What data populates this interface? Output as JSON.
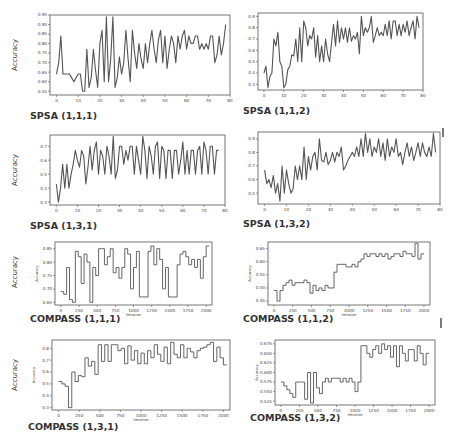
{
  "chart_data": [
    {
      "id": "spsa-111",
      "type": "line",
      "title": "SPSA (1,1,1)",
      "xlabel": "",
      "ylabel": "Accuracy",
      "outer_ylabel": "Accuracy",
      "xlim": [
        -3,
        80
      ],
      "ylim": [
        0.53,
        0.95
      ],
      "xticks": [
        0,
        10,
        20,
        30,
        40,
        50,
        60,
        70,
        80
      ],
      "yticks": [
        0.55,
        0.6,
        0.65,
        0.7,
        0.75,
        0.8,
        0.85,
        0.9,
        0.95
      ],
      "ytick_labels": [
        "0.55",
        "0.60",
        "0.65",
        "0.70",
        "0.75",
        "0.80",
        "0.85",
        "0.90",
        "0.95"
      ],
      "x": [
        0,
        1,
        2,
        3,
        4,
        5,
        6,
        7,
        8,
        9,
        10,
        11,
        12,
        13,
        14,
        15,
        16,
        17,
        18,
        19,
        20,
        21,
        22,
        23,
        24,
        25,
        26,
        27,
        28,
        29,
        30,
        31,
        32,
        33,
        34,
        35,
        36,
        37,
        38,
        39,
        40,
        41,
        42,
        43,
        44,
        45,
        46,
        47,
        48,
        49,
        50,
        51,
        52,
        53,
        54,
        55,
        56,
        57,
        58,
        59,
        60,
        61,
        62,
        63,
        64,
        65,
        66,
        67,
        68,
        69,
        70,
        71,
        72,
        73,
        74,
        75,
        76,
        77,
        78
      ],
      "y": [
        0.64,
        0.7,
        0.84,
        0.64,
        0.64,
        0.64,
        0.64,
        0.62,
        0.6,
        0.62,
        0.64,
        0.64,
        0.55,
        0.55,
        0.77,
        0.57,
        0.62,
        0.77,
        0.66,
        0.57,
        0.8,
        0.87,
        0.6,
        0.94,
        0.6,
        0.72,
        0.94,
        0.57,
        0.62,
        0.73,
        0.64,
        0.7,
        0.87,
        0.72,
        0.6,
        0.87,
        0.75,
        0.67,
        0.8,
        0.72,
        0.67,
        0.8,
        0.7,
        0.8,
        0.87,
        0.77,
        0.7,
        0.82,
        0.87,
        0.7,
        0.84,
        0.67,
        0.77,
        0.84,
        0.8,
        0.7,
        0.84,
        0.77,
        0.84,
        0.87,
        0.77,
        0.84,
        0.8,
        0.8,
        0.84,
        0.84,
        0.77,
        0.8,
        0.77,
        0.8,
        0.77,
        0.84,
        0.84,
        0.7,
        0.74,
        0.84,
        0.74,
        0.8,
        0.9
      ],
      "color": "#555555"
    },
    {
      "id": "spsa-112",
      "type": "line",
      "title": "SPSA (1,1,2)",
      "xlabel": "",
      "ylabel": "",
      "xlim": [
        -3,
        80
      ],
      "ylim": [
        0.25,
        0.93
      ],
      "xticks": [
        0,
        10,
        20,
        30,
        40,
        50,
        60,
        70,
        80
      ],
      "yticks": [
        0.3,
        0.4,
        0.5,
        0.6,
        0.7,
        0.8,
        0.9
      ],
      "ytick_labels": [
        "0.3",
        "0.4",
        "0.5",
        "0.6",
        "0.7",
        "0.8",
        "0.9"
      ],
      "x": [
        0,
        1,
        2,
        3,
        4,
        5,
        6,
        7,
        8,
        9,
        10,
        11,
        12,
        13,
        14,
        15,
        16,
        17,
        18,
        19,
        20,
        21,
        22,
        23,
        24,
        25,
        26,
        27,
        28,
        29,
        30,
        31,
        32,
        33,
        34,
        35,
        36,
        37,
        38,
        39,
        40,
        41,
        42,
        43,
        44,
        45,
        46,
        47,
        48,
        49,
        50,
        51,
        52,
        53,
        54,
        55,
        56,
        57,
        58,
        59,
        60,
        61,
        62,
        63,
        64,
        65,
        66,
        67,
        68,
        69,
        70,
        71,
        72,
        73,
        74,
        75,
        76,
        77,
        78
      ],
      "y": [
        0.4,
        0.46,
        0.27,
        0.37,
        0.4,
        0.7,
        0.64,
        0.76,
        0.5,
        0.46,
        0.27,
        0.3,
        0.43,
        0.46,
        0.56,
        0.55,
        0.7,
        0.5,
        0.8,
        0.5,
        0.86,
        0.8,
        0.64,
        0.73,
        0.7,
        0.8,
        0.54,
        0.73,
        0.5,
        0.64,
        0.5,
        0.7,
        0.57,
        0.5,
        0.67,
        0.83,
        0.64,
        0.86,
        0.67,
        0.8,
        0.7,
        0.8,
        0.67,
        0.8,
        0.68,
        0.73,
        0.7,
        0.76,
        0.57,
        0.9,
        0.73,
        0.8,
        0.76,
        0.8,
        0.9,
        0.67,
        0.73,
        0.8,
        0.73,
        0.76,
        0.73,
        0.83,
        0.73,
        0.86,
        0.7,
        0.86,
        0.86,
        0.73,
        0.83,
        0.73,
        0.83,
        0.76,
        0.86,
        0.73,
        0.8,
        0.86,
        0.7,
        0.9,
        0.8
      ],
      "color": "#555555"
    },
    {
      "id": "spsa-131",
      "type": "line",
      "title": "SPSA  (1,3,1)",
      "xlabel": "",
      "ylabel": "Accuracy",
      "outer_ylabel": "Accuracy",
      "xlim": [
        -3,
        80
      ],
      "ylim": [
        0.28,
        0.78
      ],
      "xticks": [
        0,
        10,
        20,
        30,
        40,
        50,
        60,
        70,
        80
      ],
      "yticks": [
        0.3,
        0.4,
        0.5,
        0.6,
        0.7
      ],
      "ytick_labels": [
        "0.3",
        "0.4",
        "0.5",
        "0.6",
        "0.7"
      ],
      "x": [
        0,
        1,
        2,
        3,
        4,
        5,
        6,
        7,
        8,
        9,
        10,
        11,
        12,
        13,
        14,
        15,
        16,
        17,
        18,
        19,
        20,
        21,
        22,
        23,
        24,
        25,
        26,
        27,
        28,
        29,
        30,
        31,
        32,
        33,
        34,
        35,
        36,
        37,
        38,
        39,
        40,
        41,
        42,
        43,
        44,
        45,
        46,
        47,
        48,
        49,
        50,
        51,
        52,
        53,
        54,
        55,
        56,
        57,
        58,
        59,
        60,
        61,
        62,
        63,
        64,
        65,
        66,
        67,
        68,
        69,
        70,
        71,
        72,
        73,
        74,
        75,
        76,
        77,
        78
      ],
      "y": [
        0.43,
        0.3,
        0.4,
        0.57,
        0.4,
        0.57,
        0.4,
        0.5,
        0.57,
        0.67,
        0.6,
        0.55,
        0.67,
        0.63,
        0.43,
        0.55,
        0.7,
        0.53,
        0.67,
        0.73,
        0.5,
        0.67,
        0.63,
        0.5,
        0.7,
        0.63,
        0.5,
        0.77,
        0.47,
        0.53,
        0.7,
        0.7,
        0.57,
        0.67,
        0.6,
        0.7,
        0.7,
        0.5,
        0.7,
        0.6,
        0.5,
        0.77,
        0.67,
        0.47,
        0.7,
        0.63,
        0.5,
        0.7,
        0.73,
        0.47,
        0.7,
        0.67,
        0.47,
        0.67,
        0.67,
        0.47,
        0.67,
        0.67,
        0.5,
        0.6,
        0.73,
        0.5,
        0.67,
        0.5,
        0.67,
        0.67,
        0.5,
        0.67,
        0.7,
        0.5,
        0.73,
        0.67,
        0.5,
        0.7,
        0.7,
        0.5,
        0.67,
        0.67
      ],
      "color": "#555555"
    },
    {
      "id": "spsa-132",
      "type": "line",
      "title": "SPSA  (1,3,2)",
      "xlabel": "",
      "ylabel": "",
      "xlim": [
        -3,
        80
      ],
      "ylim": [
        0.42,
        0.95
      ],
      "xticks": [
        0,
        10,
        20,
        30,
        40,
        50,
        60,
        70,
        80
      ],
      "yticks": [
        0.5,
        0.6,
        0.7,
        0.8,
        0.9
      ],
      "ytick_labels": [
        "0.5",
        "0.6",
        "0.7",
        "0.8",
        "0.9"
      ],
      "x": [
        0,
        1,
        2,
        3,
        4,
        5,
        6,
        7,
        8,
        9,
        10,
        11,
        12,
        13,
        14,
        15,
        16,
        17,
        18,
        19,
        20,
        21,
        22,
        23,
        24,
        25,
        26,
        27,
        28,
        29,
        30,
        31,
        32,
        33,
        34,
        35,
        36,
        37,
        38,
        39,
        40,
        41,
        42,
        43,
        44,
        45,
        46,
        47,
        48,
        49,
        50,
        51,
        52,
        53,
        54,
        55,
        56,
        57,
        58,
        59,
        60,
        61,
        62,
        63,
        64,
        65,
        66,
        67,
        68,
        69,
        70,
        71,
        72,
        73,
        74,
        75,
        76,
        77,
        78
      ],
      "y": [
        0.67,
        0.57,
        0.6,
        0.54,
        0.63,
        0.5,
        0.57,
        0.44,
        0.7,
        0.5,
        0.67,
        0.57,
        0.5,
        0.53,
        0.7,
        0.6,
        0.7,
        0.6,
        0.84,
        0.6,
        0.77,
        0.67,
        0.77,
        0.8,
        0.67,
        0.9,
        0.74,
        0.73,
        0.8,
        0.71,
        0.74,
        0.8,
        0.73,
        0.8,
        0.77,
        0.84,
        0.67,
        0.7,
        0.74,
        0.77,
        0.8,
        0.77,
        0.84,
        0.77,
        0.9,
        0.77,
        0.94,
        0.8,
        0.9,
        0.77,
        0.84,
        0.8,
        0.9,
        0.77,
        0.87,
        0.74,
        0.9,
        0.77,
        0.84,
        0.8,
        0.9,
        0.77,
        0.8,
        0.71,
        0.8,
        0.87,
        0.77,
        0.84,
        0.74,
        0.8,
        0.87,
        0.77,
        0.87,
        0.8,
        0.77,
        0.84,
        0.77,
        0.94,
        0.8
      ],
      "color": "#555555"
    },
    {
      "id": "compass-111",
      "type": "line",
      "step": true,
      "title": "COMPASS (1,1,1)",
      "xlabel": "Iteration",
      "ylabel": "Accuracy",
      "outer_ylabel": "Accuracy",
      "xlim": [
        -80,
        2080
      ],
      "ylim": [
        0.64,
        0.875
      ],
      "xticks": [
        0,
        250,
        500,
        750,
        1000,
        1250,
        1500,
        1750,
        2000
      ],
      "yticks": [
        0.65,
        0.7,
        0.75,
        0.8,
        0.85
      ],
      "ytick_labels": [
        "0.65",
        "0.70",
        "0.75",
        "0.80",
        "0.85"
      ],
      "x": [
        0,
        40,
        80,
        120,
        160,
        200,
        240,
        280,
        320,
        360,
        400,
        440,
        480,
        520,
        560,
        600,
        640,
        680,
        720,
        760,
        800,
        840,
        880,
        920,
        960,
        1000,
        1040,
        1080,
        1120,
        1160,
        1200,
        1240,
        1280,
        1320,
        1360,
        1400,
        1440,
        1480,
        1520,
        1560,
        1600,
        1640,
        1680,
        1720,
        1760,
        1800,
        1840,
        1880,
        1920,
        1960,
        2000
      ],
      "y": [
        0.69,
        0.68,
        0.78,
        0.66,
        0.65,
        0.84,
        0.82,
        0.72,
        0.83,
        0.8,
        0.65,
        0.78,
        0.75,
        0.85,
        0.85,
        0.79,
        0.82,
        0.85,
        0.76,
        0.78,
        0.74,
        0.78,
        0.85,
        0.83,
        0.7,
        0.78,
        0.84,
        0.67,
        0.67,
        0.67,
        0.84,
        0.86,
        0.79,
        0.85,
        0.81,
        0.7,
        0.78,
        0.67,
        0.67,
        0.67,
        0.79,
        0.83,
        0.84,
        0.82,
        0.79,
        0.81,
        0.78,
        0.81,
        0.74,
        0.82,
        0.86
      ],
      "color": "#555555"
    },
    {
      "id": "compass-112",
      "type": "line",
      "step": true,
      "title": "COMPASS (1,1,2)",
      "xlabel": "Iteration",
      "ylabel": "Accuracy",
      "xlim": [
        -80,
        2080
      ],
      "ylim": [
        0.435,
        0.675
      ],
      "xticks": [
        0,
        250,
        500,
        750,
        1000,
        1250,
        1500,
        1750,
        2000
      ],
      "yticks": [
        0.45,
        0.5,
        0.55,
        0.6,
        0.65
      ],
      "ytick_labels": [
        "0.45",
        "0.50",
        "0.55",
        "0.60",
        "0.65"
      ],
      "x": [
        0,
        40,
        80,
        120,
        160,
        200,
        240,
        280,
        320,
        360,
        400,
        440,
        480,
        520,
        560,
        600,
        640,
        680,
        720,
        760,
        800,
        840,
        880,
        920,
        960,
        1000,
        1040,
        1080,
        1120,
        1160,
        1200,
        1240,
        1280,
        1320,
        1360,
        1400,
        1440,
        1480,
        1520,
        1560,
        1600,
        1640,
        1680,
        1720,
        1760,
        1800,
        1840,
        1880,
        1920,
        1960
      ],
      "y": [
        0.49,
        0.45,
        0.49,
        0.51,
        0.52,
        0.53,
        0.51,
        0.52,
        0.52,
        0.52,
        0.53,
        0.52,
        0.48,
        0.51,
        0.49,
        0.5,
        0.49,
        0.51,
        0.5,
        0.5,
        0.56,
        0.59,
        0.59,
        0.59,
        0.58,
        0.58,
        0.59,
        0.58,
        0.6,
        0.61,
        0.63,
        0.62,
        0.63,
        0.63,
        0.62,
        0.63,
        0.62,
        0.63,
        0.61,
        0.62,
        0.63,
        0.63,
        0.62,
        0.64,
        0.63,
        0.63,
        0.62,
        0.67,
        0.61,
        0.63
      ],
      "color": "#555555"
    },
    {
      "id": "compass-131",
      "type": "line",
      "step": true,
      "title": "COMPASS (1,3,1)",
      "xlabel": "Iteration",
      "ylabel": "Accuracy",
      "outer_ylabel": "Accuracy",
      "xlim": [
        -80,
        2080
      ],
      "ylim": [
        0.28,
        0.87
      ],
      "xticks": [
        0,
        250,
        500,
        750,
        1000,
        1250,
        1500,
        1750,
        2000
      ],
      "yticks": [
        0.3,
        0.4,
        0.5,
        0.6,
        0.7,
        0.8
      ],
      "ytick_labels": [
        "0.3",
        "0.4",
        "0.5",
        "0.6",
        "0.7",
        "0.8"
      ],
      "x": [
        0,
        40,
        80,
        120,
        160,
        200,
        240,
        280,
        320,
        360,
        400,
        440,
        480,
        520,
        560,
        600,
        640,
        680,
        720,
        760,
        800,
        840,
        880,
        920,
        960,
        1000,
        1040,
        1080,
        1120,
        1160,
        1200,
        1240,
        1280,
        1320,
        1360,
        1400,
        1440,
        1480,
        1520,
        1560,
        1600,
        1640,
        1680,
        1720,
        1760,
        1800,
        1840,
        1880,
        1920,
        1960,
        2000
      ],
      "y": [
        0.52,
        0.5,
        0.48,
        0.3,
        0.6,
        0.52,
        0.57,
        0.56,
        0.72,
        0.65,
        0.69,
        0.58,
        0.83,
        0.69,
        0.83,
        0.69,
        0.83,
        0.83,
        0.78,
        0.8,
        0.67,
        0.82,
        0.7,
        0.78,
        0.67,
        0.76,
        0.67,
        0.78,
        0.72,
        0.83,
        0.75,
        0.69,
        0.81,
        0.67,
        0.85,
        0.75,
        0.72,
        0.83,
        0.72,
        0.8,
        0.77,
        0.72,
        0.78,
        0.8,
        0.81,
        0.83,
        0.85,
        0.69,
        0.81,
        0.72,
        0.66
      ],
      "color": "#555555"
    },
    {
      "id": "compass-132",
      "type": "line",
      "step": true,
      "title": "COMPASS (1,3,2)",
      "xlabel": "Iteration",
      "ylabel": "Accuracy",
      "xlim": [
        -80,
        2080
      ],
      "ylim": [
        0.515,
        0.685
      ],
      "xticks": [
        0,
        250,
        500,
        750,
        1000,
        1250,
        1500,
        1750,
        2000
      ],
      "yticks": [
        0.525,
        0.55,
        0.575,
        0.6,
        0.625,
        0.65,
        0.675
      ],
      "ytick_labels": [
        "0.525",
        "0.550",
        "0.575",
        "0.600",
        "0.625",
        "0.650",
        "0.675"
      ],
      "x": [
        0,
        40,
        80,
        120,
        160,
        200,
        240,
        280,
        320,
        360,
        400,
        440,
        480,
        520,
        560,
        600,
        640,
        680,
        720,
        760,
        800,
        840,
        880,
        920,
        960,
        1000,
        1040,
        1080,
        1120,
        1160,
        1200,
        1240,
        1280,
        1320,
        1360,
        1400,
        1440,
        1480,
        1520,
        1560,
        1600,
        1640,
        1680,
        1720,
        1760,
        1800,
        1840,
        1880,
        1920,
        1960
      ],
      "y": [
        0.575,
        0.565,
        0.555,
        0.545,
        0.535,
        0.575,
        0.575,
        0.575,
        0.53,
        0.6,
        0.52,
        0.6,
        0.56,
        0.545,
        0.575,
        0.585,
        0.575,
        0.585,
        0.585,
        0.585,
        0.575,
        0.585,
        0.575,
        0.585,
        0.575,
        0.55,
        0.575,
        0.67,
        0.67,
        0.65,
        0.64,
        0.66,
        0.67,
        0.65,
        0.675,
        0.66,
        0.67,
        0.64,
        0.67,
        0.615,
        0.67,
        0.65,
        0.63,
        0.66,
        0.66,
        0.63,
        0.67,
        0.65,
        0.62,
        0.65
      ],
      "color": "#555555"
    }
  ],
  "layout_labels": {
    "accuracy_outer": "Accuracy",
    "inner_ylabel": "Accuracy",
    "xlabel_iteration": "Iteration"
  }
}
